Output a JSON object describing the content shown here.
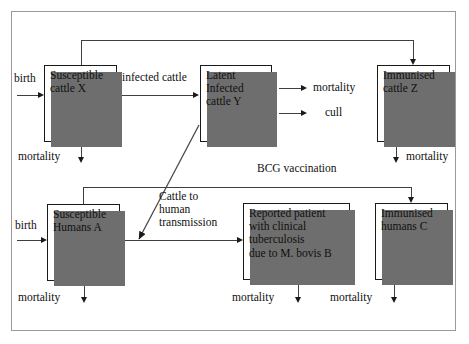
{
  "diagram": {
    "frame_color": "#9a9a9a",
    "box_border_color": "#1a1a1a",
    "shadow_color": "#6e6e6e",
    "line_color": "#3f3f3f",
    "nodes": [
      {
        "id": "cattle-x",
        "label": "Susceptible\ncattle X"
      },
      {
        "id": "cattle-y",
        "label": "Latent\nInfected\ncattle Y"
      },
      {
        "id": "cattle-z",
        "label": "Immunised\ncattle Z"
      },
      {
        "id": "humans-a",
        "label": "Susceptible\nHumans A"
      },
      {
        "id": "patient-b",
        "label": "Reported patient\nwith clinical\ntuberculosis\ndue to M. bovis  B"
      },
      {
        "id": "humans-c",
        "label": "Immunised\nhumans C"
      }
    ],
    "edge_labels": {
      "birth_cattle": "birth",
      "birth_humans": "birth",
      "infected_cattle": "infected cattle",
      "mortality_cattle_x": "mortality",
      "mortality_cattle_y": "mortality",
      "cull_cattle_y": "cull",
      "mortality_cattle_z": "mortality",
      "mortality_humans_a": "mortality",
      "mortality_patient_b": "mortality",
      "mortality_humans_c": "mortality",
      "bcg_vaccination": "BCG vaccination",
      "cattle_to_human": "Cattle to\nhuman\ntransmission"
    }
  }
}
